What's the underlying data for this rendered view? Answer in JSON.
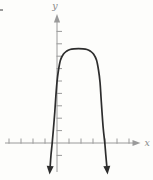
{
  "figure": {
    "background": "#fdfdfb"
  },
  "chart_data": {
    "type": "line",
    "xlabel": "x",
    "ylabel": "y",
    "style": "hand-drawn textbook figure, no numeric tick labels",
    "equation_approx": "y ≈ -1.6(x + 0.4)(x − 4)",
    "opens": "down",
    "x_intercepts": [
      -0.4,
      4
    ],
    "vertex": {
      "x": 1.8,
      "y": 7.6
    },
    "x_ticks": [
      -4,
      -3,
      -2,
      -1,
      1,
      2,
      3,
      4,
      5,
      6
    ],
    "y_ticks": [
      -1,
      1,
      2,
      3,
      4,
      5,
      6,
      7,
      8,
      9
    ],
    "xlim": [
      -4.3,
      7.0
    ],
    "ylim": [
      -2.4,
      10.4
    ],
    "grid": false,
    "legend": null,
    "axis_color": "#9a9a9a",
    "tick_color": "#9a9a9a",
    "curve_color": "#2d2d2d",
    "label_color": "#8a8a8a",
    "curve_ends": "both branches end in solid downward arrowheads below the x-axis",
    "curve_points_px": [
      [
        50.2,
        166
      ],
      [
        51,
        155
      ],
      [
        52.2,
        143
      ],
      [
        53.5,
        128
      ],
      [
        54.8,
        112
      ],
      [
        55.8,
        97
      ],
      [
        57,
        82
      ],
      [
        58.5,
        70
      ],
      [
        60.5,
        60
      ],
      [
        63.5,
        54
      ],
      [
        66.5,
        51.2
      ],
      [
        70,
        49.5
      ],
      [
        74,
        48.8
      ],
      [
        78.5,
        48.6
      ],
      [
        83,
        48.8
      ],
      [
        87,
        49.5
      ],
      [
        90.5,
        51.2
      ],
      [
        93.5,
        54
      ],
      [
        96.5,
        60
      ],
      [
        98.5,
        70
      ],
      [
        100,
        82
      ],
      [
        101,
        97
      ],
      [
        102,
        112
      ],
      [
        103.2,
        128
      ],
      [
        104.8,
        143
      ],
      [
        105.8,
        155
      ],
      [
        106.8,
        166
      ]
    ]
  }
}
